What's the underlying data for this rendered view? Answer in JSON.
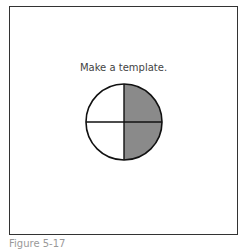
{
  "prompt": "Make a template.",
  "caption": "Figure 5-17",
  "circle": {
    "quadrants": [
      {
        "position": "top-left",
        "shaded": false
      },
      {
        "position": "top-right",
        "shaded": true
      },
      {
        "position": "bottom-right",
        "shaded": true
      },
      {
        "position": "bottom-left",
        "shaded": false
      }
    ],
    "shade_color": "#8a8a8a"
  }
}
